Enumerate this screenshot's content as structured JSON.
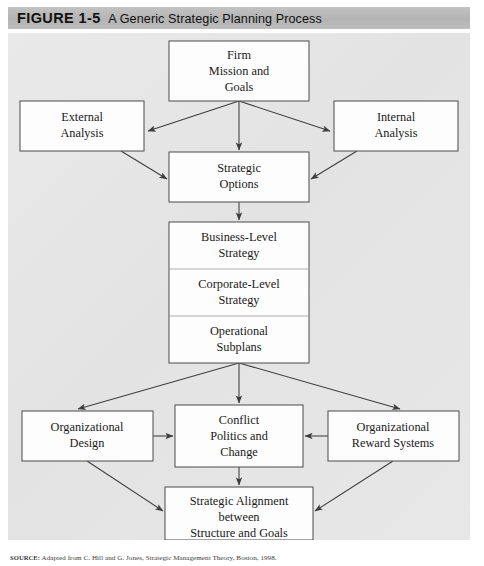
{
  "header": {
    "figure_label": "FIGURE 1-5",
    "title": "A Generic Strategic Planning Process"
  },
  "source": {
    "label": "SOURCE:",
    "text": "Adapted from C. Hill and G. Jones, Strategic Management Theory, Boston, 1998."
  },
  "colors": {
    "header_bar": "#b9b9b9",
    "panel_background": "#e6e6e6",
    "box_fill": "#fdfdfd",
    "box_stroke": "#5a5a5a",
    "arrow_stroke": "#3d3d3d",
    "text": "#1a1a1a"
  },
  "diagram": {
    "type": "flowchart",
    "nodes": [
      {
        "id": "firm-mission",
        "lines": [
          "Firm",
          "Mission and",
          "Goals"
        ],
        "x": 161,
        "y": 8,
        "w": 140,
        "h": 60
      },
      {
        "id": "external-analysis",
        "lines": [
          "External",
          "Analysis"
        ],
        "x": 12,
        "y": 68,
        "w": 124,
        "h": 50
      },
      {
        "id": "internal-analysis",
        "lines": [
          "Internal",
          "Analysis"
        ],
        "x": 326,
        "y": 68,
        "w": 124,
        "h": 50
      },
      {
        "id": "strategic-options",
        "lines": [
          "Strategic",
          "Options"
        ],
        "x": 161,
        "y": 119,
        "w": 140,
        "h": 50
      },
      {
        "id": "business-level-strategy",
        "lines": [
          "Business-Level",
          "Strategy"
        ],
        "x": 161,
        "y": 189,
        "w": 140,
        "h": 47
      },
      {
        "id": "corporate-level-strategy",
        "lines": [
          "Corporate-Level",
          "Strategy"
        ],
        "x": 161,
        "y": 236,
        "w": 140,
        "h": 47
      },
      {
        "id": "operational-subplans",
        "lines": [
          "Operational",
          "Subplans"
        ],
        "x": 161,
        "y": 283,
        "w": 140,
        "h": 47
      },
      {
        "id": "organizational-design",
        "lines": [
          "Organizational",
          "Design"
        ],
        "x": 14,
        "y": 378,
        "w": 131,
        "h": 50
      },
      {
        "id": "conflict-politics-change",
        "lines": [
          "Conflict",
          "Politics and",
          "Change"
        ],
        "x": 167,
        "y": 372,
        "w": 128,
        "h": 62
      },
      {
        "id": "organizational-reward-systems",
        "lines": [
          "Organizational",
          "Reward Systems"
        ],
        "x": 320,
        "y": 378,
        "w": 131,
        "h": 50
      },
      {
        "id": "strategic-alignment",
        "lines": [
          "Strategic Alignment",
          "between",
          "Structure and Goals"
        ],
        "x": 157,
        "y": 454,
        "w": 148,
        "h": 53
      }
    ],
    "edges": [
      {
        "from": "firm-mission",
        "to": "external-analysis",
        "style": "arrow"
      },
      {
        "from": "firm-mission",
        "to": "internal-analysis",
        "style": "arrow"
      },
      {
        "from": "firm-mission",
        "to": "strategic-options",
        "style": "arrow"
      },
      {
        "from": "external-analysis",
        "to": "strategic-options",
        "style": "arrow"
      },
      {
        "from": "internal-analysis",
        "to": "strategic-options",
        "style": "arrow"
      },
      {
        "from": "strategic-options",
        "to": "business-level-strategy",
        "style": "arrow"
      },
      {
        "from": "operational-subplans",
        "to": "organizational-design",
        "style": "arrow"
      },
      {
        "from": "operational-subplans",
        "to": "conflict-politics-change",
        "style": "arrow"
      },
      {
        "from": "operational-subplans",
        "to": "organizational-reward-systems",
        "style": "arrow"
      },
      {
        "from": "organizational-design",
        "to": "conflict-politics-change",
        "style": "arrow"
      },
      {
        "from": "organizational-reward-systems",
        "to": "conflict-politics-change",
        "style": "arrow"
      },
      {
        "from": "conflict-politics-change",
        "to": "strategic-alignment",
        "style": "arrow"
      },
      {
        "from": "organizational-design",
        "to": "strategic-alignment",
        "style": "arrow"
      },
      {
        "from": "organizational-reward-systems",
        "to": "strategic-alignment",
        "style": "arrow"
      }
    ]
  }
}
